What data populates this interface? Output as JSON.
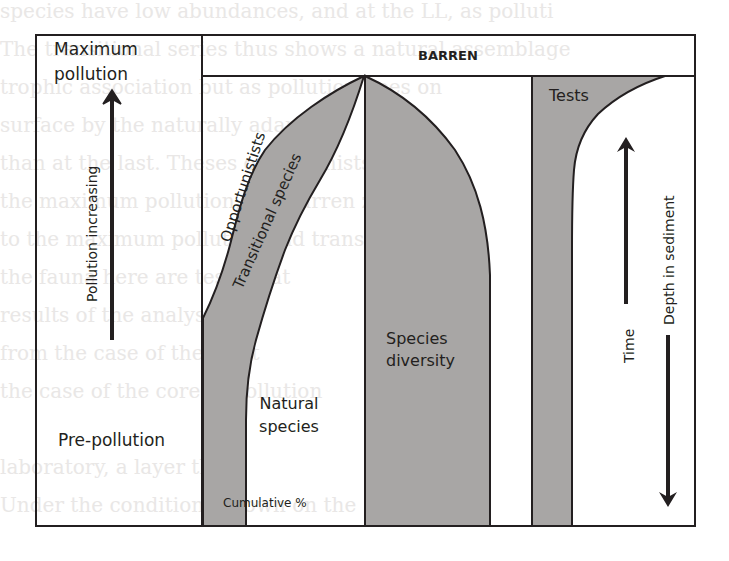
{
  "colors": {
    "shade": "#a8a6a5",
    "line": "#231f20",
    "background": "#ffffff",
    "bleed_text": "#e9e7e6"
  },
  "labels": {
    "maximum_pollution_line1": "Maximum",
    "maximum_pollution_line2": "pollution",
    "pollution_increasing": "Pollution increasing",
    "pre_pollution": "Pre-pollution",
    "barren": "BARREN",
    "opportunists": "Opportunistists",
    "transitional_species": "Transitional species",
    "natural_species_line1": "Natural",
    "natural_species_line2": "species",
    "cumulative_percent": "Cumulative %",
    "species_diversity_line1": "Species",
    "species_diversity_line2": "diversity",
    "tests": "Tests",
    "time": "Time",
    "depth_in_sediment": "Depth in sediment"
  },
  "arrows": {
    "pollution_direction": "up",
    "time_direction": "up",
    "depth_direction": "down"
  },
  "bleed_through_lines": [
    "species have low abundances, and at the LL, as polluti",
    "The transitional series thus shows a natural assemblage",
    "trophic association but as pollution goes on",
    "surface by the naturally adapted",
    "than at the last. Theses opportunists",
    "the maximum pollution, the barren zone",
    "to the maximum pollution and transitional",
    "the fauna here are tests that",
    "results of the analysis",
    "from the case of the right",
    "the case of the core of pollution",
    "",
    "laboratory, a layer that",
    "Under the conditions shown on the"
  ]
}
